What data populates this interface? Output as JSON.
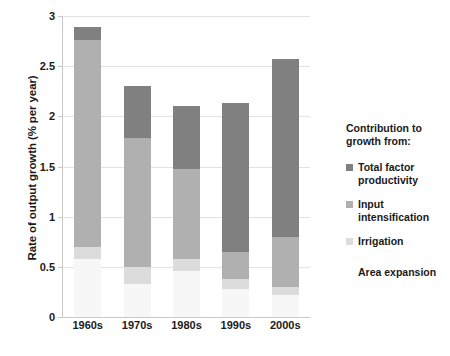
{
  "chart_data": {
    "type": "bar",
    "subtype": "stacked",
    "title": "",
    "xlabel": "",
    "ylabel": "Rate of output growth (% per year)",
    "categories": [
      "1960s",
      "1970s",
      "1980s",
      "1990s",
      "2000s"
    ],
    "ylim": [
      0,
      3
    ],
    "yticks": [
      "0",
      "0.5",
      "1",
      "1.5",
      "2",
      "2.5",
      "3"
    ],
    "ytick_values": [
      0,
      0.5,
      1,
      1.5,
      2,
      2.5,
      3
    ],
    "grid": true,
    "legend_position": "right",
    "series": [
      {
        "name": "Area expansion",
        "color": "#f7f7f7",
        "values": [
          0.58,
          0.33,
          0.46,
          0.28,
          0.22
        ]
      },
      {
        "name": "Irrigation",
        "color": "#dcdcdc",
        "values": [
          0.12,
          0.17,
          0.12,
          0.1,
          0.08
        ]
      },
      {
        "name": "Input intensification",
        "color": "#b0b0b0",
        "values": [
          2.06,
          1.28,
          0.9,
          0.27,
          0.5
        ]
      },
      {
        "name": "Total factor productivity",
        "color": "#808080",
        "values": [
          0.13,
          0.52,
          0.62,
          1.48,
          1.77
        ]
      }
    ],
    "totals": [
      2.89,
      2.3,
      2.1,
      2.13,
      2.57
    ]
  },
  "legend": {
    "title": "Contribution to growth from:",
    "entries": [
      {
        "label": "Total factor productivity",
        "color": "#808080"
      },
      {
        "label": "Input intensification",
        "color": "#b0b0b0"
      },
      {
        "label": "Irrigation",
        "color": "#dcdcdc"
      }
    ],
    "footer": "Area expansion"
  }
}
